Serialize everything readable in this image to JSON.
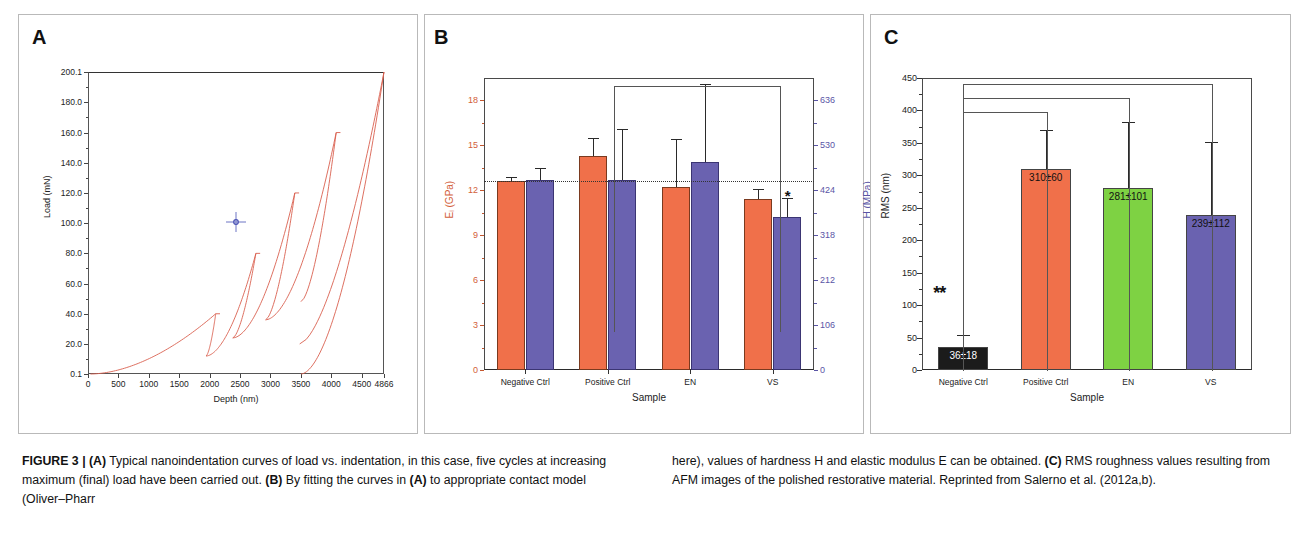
{
  "figure": {
    "label": "FIGURE 3 |",
    "caption_left_html": "<b>FIGURE 3 | (A)</b> Typical nanoindentation curves of load vs. indentation, in this case, five cycles at increasing maximum (final) load have been carried out. <b>(B)</b> By fitting the curves in <b>(A)</b> to appropriate contact model (Oliver–Pharr",
    "caption_right_html": "here), values of hardness H and elastic modulus E can be obtained. <b>(C)</b> RMS roughness values resulting from AFM images of the polished restorative material. Reprinted from Salerno et al. (2012a,b)."
  },
  "panels": {
    "a": {
      "letter": "A"
    },
    "b": {
      "letter": "B"
    },
    "c": {
      "letter": "C"
    }
  },
  "colors": {
    "orange": "#F0704A",
    "purple": "#6A62B0",
    "green": "#7ED243",
    "black": "#1B1B1B",
    "curve_red": "#D9604F",
    "axis_left_b": "#D2603A",
    "axis_right_b": "#5A55A6",
    "cursor_blue": "#6C74C4"
  },
  "chart_data": [
    {
      "id": "panel-a",
      "type": "line",
      "title": "",
      "xlabel": "Depth (nm)",
      "ylabel": "Load (mN)",
      "xlim": [
        0,
        4866
      ],
      "ylim": [
        0.1,
        200.1
      ],
      "xticks": [
        0,
        500,
        1000,
        1500,
        2000,
        2500,
        3000,
        3000,
        3500,
        4000,
        4500,
        4866
      ],
      "xticklabels": [
        "0",
        "500",
        "1000",
        "1500",
        "2000",
        "2500",
        "3000",
        "3500",
        "4000",
        "4500",
        "4866"
      ],
      "yticklabels": [
        "200.1",
        "180.0",
        "160.0",
        "140.0",
        "120.0",
        "100.0",
        "80.0",
        "60.0",
        "40.0",
        "20.0",
        "0.1"
      ],
      "yticks": [
        200.1,
        180.0,
        160.0,
        140.0,
        120.0,
        100.0,
        80.0,
        60.0,
        40.0,
        20.0,
        0.1
      ],
      "grid": false,
      "legend": null,
      "annotations": [
        {
          "name": "cursor-crosshair",
          "x": 2430,
          "y": 101.0
        }
      ],
      "description": "Five load-unload nanoindentation cycles with increasing maximum load: 40, 80, 120, 160 and 200 mN.",
      "cycle_peak_loads_mN": [
        40.0,
        80.0,
        120.0,
        160.0,
        200.1
      ],
      "cycle_peak_depths_nm": [
        2100,
        2760,
        3400,
        4080,
        4866
      ],
      "cycle_unload_end_depths_nm": [
        1940,
        2380,
        2920,
        3500,
        3480
      ]
    },
    {
      "id": "panel-b",
      "type": "bar",
      "title": "",
      "xlabel": "Sample",
      "ylabel_left": "Eᵢ (GPa)",
      "ylabel_right": "H (MPa)",
      "categories": [
        "Negative Ctrl",
        "Positive Ctrl",
        "EN",
        "VS"
      ],
      "ylim_left": [
        0,
        19.5
      ],
      "yticks_left": [
        0,
        3,
        6,
        9,
        12,
        15,
        18
      ],
      "ylim_right": [
        0,
        689
      ],
      "yticks_right": [
        0,
        106,
        212,
        318,
        424,
        530,
        636
      ],
      "grid": false,
      "series": [
        {
          "name": "Eᵢ (GPa)",
          "color": "#F0704A",
          "values": [
            12.6,
            14.3,
            12.2,
            11.4
          ],
          "errors": [
            0.3,
            1.2,
            3.2,
            0.7
          ]
        },
        {
          "name": "H (MPa)",
          "color": "#6A62B0",
          "values": [
            12.7,
            12.7,
            13.9,
            10.2
          ],
          "errors": [
            0.8,
            3.4,
            5.2,
            1.3
          ]
        }
      ],
      "reference_line_y": 12.6,
      "annotations": [
        {
          "name": "significance-star",
          "symbol": "*",
          "category": "VS"
        },
        {
          "name": "significance-bracket",
          "from": "Positive Ctrl",
          "to": "VS"
        }
      ]
    },
    {
      "id": "panel-c",
      "type": "bar",
      "title": "",
      "xlabel": "Sample",
      "ylabel": "RMS (nm)",
      "categories": [
        "Negative Ctrl",
        "Positive Ctrl",
        "EN",
        "VS"
      ],
      "ylim": [
        0,
        450
      ],
      "yticks": [
        0,
        50,
        100,
        150,
        200,
        250,
        300,
        350,
        400,
        450
      ],
      "grid": false,
      "values": [
        36,
        310,
        281,
        239
      ],
      "errors": [
        18,
        60,
        101,
        112
      ],
      "bar_colors": [
        "#1B1B1B",
        "#F0704A",
        "#7ED243",
        "#6A62B0"
      ],
      "bar_labels": [
        "36±18",
        "310±60",
        "281±101",
        "239±112"
      ],
      "annotations": [
        {
          "name": "significance-stars",
          "symbol": "**",
          "category": "Negative Ctrl"
        },
        {
          "name": "significance-bracket-1",
          "from": "Negative Ctrl",
          "to": "Positive Ctrl"
        },
        {
          "name": "significance-bracket-2",
          "from": "Negative Ctrl",
          "to": "EN"
        },
        {
          "name": "significance-bracket-3",
          "from": "Negative Ctrl",
          "to": "VS"
        }
      ]
    }
  ]
}
